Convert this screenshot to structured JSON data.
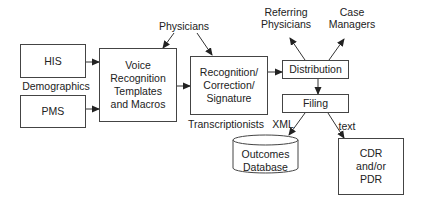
{
  "diagram": {
    "type": "flowchart",
    "nodes": {
      "his": "HIS",
      "pms": "PMS",
      "voice": [
        "Voice",
        "Recognition",
        "Templates",
        "and Macros"
      ],
      "recognition": [
        "Recognition/",
        "Correction/",
        "Signature"
      ],
      "distribution": "Distribution",
      "filing": "Filing",
      "outcomes_db": [
        "Outcomes",
        "Database"
      ],
      "cdr_pdr": [
        "CDR",
        "and/or",
        "PDR"
      ]
    },
    "labels": {
      "demographics": "Demographics",
      "physicians": "Physicians",
      "transcriptionists": "Transcriptionists",
      "referring_physicians": [
        "Referring",
        "Physicians"
      ],
      "case_managers": [
        "Case",
        "Managers"
      ],
      "xml": "XML",
      "text": "text"
    },
    "edges": [
      {
        "from": "HIS",
        "to": "Voice Recognition Templates and Macros"
      },
      {
        "from": "PMS",
        "to": "Voice Recognition Templates and Macros"
      },
      {
        "from": "Physicians",
        "to": "Voice Recognition Templates and Macros"
      },
      {
        "from": "Physicians",
        "to": "Recognition/Correction/Signature"
      },
      {
        "from": "Voice Recognition Templates and Macros",
        "to": "Recognition/Correction/Signature"
      },
      {
        "from": "Recognition/Correction/Signature",
        "to": "Distribution"
      },
      {
        "from": "Distribution",
        "to": "Referring Physicians"
      },
      {
        "from": "Distribution",
        "to": "Case Managers"
      },
      {
        "from": "Distribution",
        "to": "Filing"
      },
      {
        "from": "Filing",
        "to": "Outcomes Database",
        "label": "XML"
      },
      {
        "from": "Filing",
        "to": "CDR and/or PDR",
        "label": "text"
      }
    ]
  }
}
